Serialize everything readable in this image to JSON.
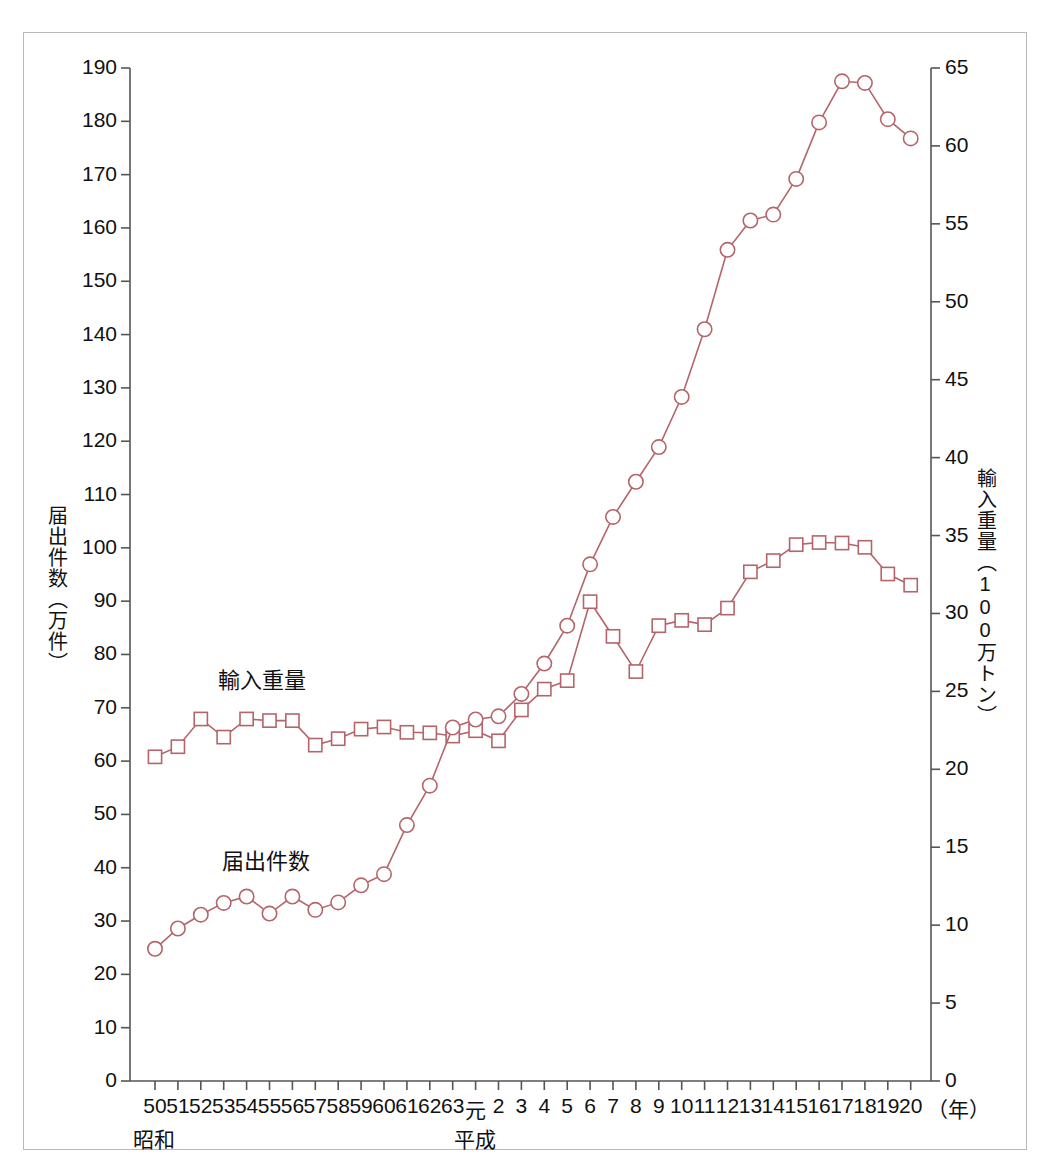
{
  "figure": {
    "frame_color": "#b9b9b9",
    "series_color": "#b5656a",
    "axis_color": "#555555",
    "background": "#ffffff"
  },
  "axes": {
    "left": {
      "title": "届出件数（万件）",
      "ticks": [
        "0",
        "10",
        "20",
        "30",
        "40",
        "50",
        "60",
        "70",
        "80",
        "90",
        "100",
        "110",
        "120",
        "130",
        "140",
        "150",
        "160",
        "170",
        "180",
        "190"
      ],
      "min": 0,
      "max": 190
    },
    "right": {
      "title": "輸入重量（100万トン）",
      "ticks": [
        "0",
        "5",
        "10",
        "15",
        "20",
        "25",
        "30",
        "35",
        "40",
        "45",
        "50",
        "55",
        "60",
        "65"
      ],
      "min": 0,
      "max": 65
    },
    "x": {
      "unit_label": "（年）",
      "era_labels": [
        {
          "text": "昭和",
          "at_category": "50"
        },
        {
          "text": "平成",
          "at_category": "元"
        }
      ],
      "categories": [
        "50",
        "51",
        "52",
        "53",
        "54",
        "55",
        "56",
        "57",
        "58",
        "59",
        "60",
        "61",
        "62",
        "63",
        "元",
        "2",
        "3",
        "4",
        "5",
        "6",
        "7",
        "8",
        "9",
        "10",
        "11",
        "12",
        "13",
        "14",
        "15",
        "16",
        "17",
        "18",
        "19",
        "20"
      ]
    }
  },
  "series_labels": {
    "import_weight": "輸入重量",
    "notifications": "届出件数"
  },
  "chart_data": {
    "type": "line",
    "title": "",
    "xlabel": "（年）",
    "ylabel": "届出件数（万件）",
    "y2label": "輸入重量（100万トン）",
    "ylim": [
      0,
      190
    ],
    "y2lim": [
      0,
      65
    ],
    "grid": false,
    "legend": "in-plot-annotations",
    "categories": [
      "50",
      "51",
      "52",
      "53",
      "54",
      "55",
      "56",
      "57",
      "58",
      "59",
      "60",
      "61",
      "62",
      "63",
      "元",
      "2",
      "3",
      "4",
      "5",
      "6",
      "7",
      "8",
      "9",
      "10",
      "11",
      "12",
      "13",
      "14",
      "15",
      "16",
      "17",
      "18",
      "19",
      "20"
    ],
    "series": [
      {
        "name": "届出件数",
        "axis": "left",
        "unit": "万件",
        "marker": "circle",
        "values": [
          24.8,
          28.6,
          31.2,
          33.4,
          34.6,
          31.4,
          34.6,
          32.1,
          33.5,
          36.7,
          38.8,
          48.0,
          55.4,
          66.3,
          67.8,
          68.4,
          72.6,
          78.3,
          85.4,
          96.9,
          105.8,
          112.4,
          118.9,
          128.3,
          141.0,
          155.9,
          161.4,
          162.5,
          169.2,
          179.8,
          187.5,
          187.2,
          180.4,
          176.8
        ]
      },
      {
        "name": "輸入重量",
        "axis": "right",
        "unit": "100万トン",
        "marker": "square",
        "values_left_scale": [
          60.8,
          62.7,
          67.9,
          64.5,
          67.9,
          67.6,
          67.6,
          63.0,
          64.2,
          66.0,
          66.4,
          65.4,
          65.3,
          64.7,
          65.7,
          63.8,
          69.6,
          73.5,
          75.1,
          89.9,
          83.4,
          76.8,
          85.4,
          86.4,
          85.6,
          88.7,
          95.5,
          97.6,
          100.6,
          101.0,
          100.9,
          100.1,
          95.1,
          93.0
        ],
        "values": [
          20.8,
          21.4,
          23.2,
          22.1,
          23.2,
          23.1,
          23.1,
          21.5,
          22.0,
          22.6,
          22.7,
          22.4,
          22.3,
          22.1,
          22.5,
          21.8,
          23.8,
          25.1,
          25.7,
          30.7,
          28.5,
          26.3,
          29.2,
          29.5,
          29.3,
          30.3,
          32.7,
          33.4,
          34.4,
          34.5,
          34.5,
          34.2,
          32.5,
          31.8
        ]
      }
    ]
  }
}
